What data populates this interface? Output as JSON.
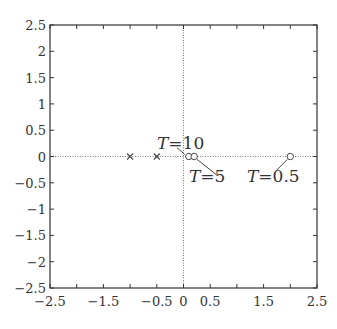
{
  "chart_data": {
    "type": "scatter",
    "title": "",
    "xlabel": "",
    "ylabel": "",
    "xlim": [
      -2.5,
      2.5
    ],
    "ylim": [
      -2.5,
      2.5
    ],
    "grid": false,
    "xticks": [
      -2.5,
      -2,
      -1.5,
      -1,
      -0.5,
      0,
      0.5,
      1,
      1.5,
      2,
      2.5
    ],
    "xtick_labels": [
      "−2.5",
      "",
      "−1.5",
      "",
      "−0.5",
      "0",
      "0.5",
      "",
      "1.5",
      "",
      "2.5"
    ],
    "yticks": [
      2.5,
      2,
      1.5,
      1,
      0.5,
      0,
      -0.5,
      -1,
      -1.5,
      -2,
      -2.5
    ],
    "ytick_labels": [
      "2.5",
      "2",
      "1.5",
      "1",
      "0.5",
      "0",
      "−0.5",
      "−1",
      "−1.5",
      "−2",
      "−2.5"
    ],
    "reference_lines": [
      {
        "orientation": "horizontal",
        "value": 0,
        "style": "dotted"
      },
      {
        "orientation": "vertical",
        "value": 0,
        "style": "dotted"
      }
    ],
    "series": [
      {
        "name": "poles",
        "marker": "x",
        "points": [
          {
            "x": -1.0,
            "y": 0
          },
          {
            "x": -0.5,
            "y": 0
          }
        ]
      },
      {
        "name": "zeros",
        "marker": "o",
        "points": [
          {
            "x": 0.1,
            "y": 0,
            "label": "T=10"
          },
          {
            "x": 0.2,
            "y": 0,
            "label": "T=5"
          },
          {
            "x": 2.0,
            "y": 0,
            "label": "T=0.5"
          }
        ]
      }
    ],
    "annotations": [
      {
        "text": "T=10",
        "point": [
          0.1,
          0
        ],
        "text_pos": [
          0.0,
          0.4
        ]
      },
      {
        "text": "T=5",
        "point": [
          0.2,
          0
        ],
        "text_pos": [
          0.6,
          -0.45
        ]
      },
      {
        "text": "T=0.5",
        "point": [
          2.0,
          0
        ],
        "text_pos": [
          1.45,
          -0.45
        ]
      }
    ]
  }
}
